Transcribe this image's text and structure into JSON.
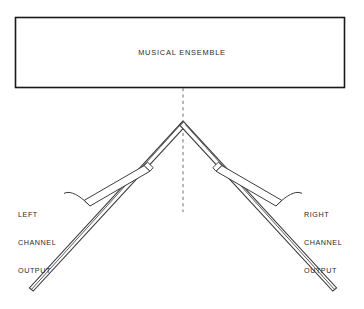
{
  "diagram": {
    "title_box": {
      "label": "MUSICAL ENSEMBLE"
    },
    "left_channel": {
      "line1": "LEFT",
      "line2": "CHANNEL",
      "line3": "OUTPUT"
    },
    "right_channel": {
      "line1": "RIGHT",
      "line2": "CHANNEL",
      "line3": "OUTPUT"
    },
    "colors": {
      "stroke": "#1a1a1a",
      "line": "#3c3c3c",
      "text": "#2b2b2b",
      "background": "#ffffff",
      "centerline": "#6e6e6e"
    }
  }
}
